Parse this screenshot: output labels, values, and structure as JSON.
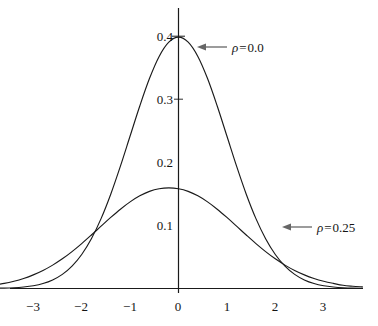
{
  "chart_data": {
    "type": "line",
    "title": "",
    "subtitle": "",
    "xlabel": "",
    "ylabel": "",
    "xlim": [
      -3.85,
      3.8
    ],
    "ylim": [
      0,
      0.44
    ],
    "grid": false,
    "legend_position": "inline-annotations",
    "x_ticks": [
      "−3",
      "−2",
      "−1",
      "0",
      "1",
      "2",
      "3"
    ],
    "x_tick_values": [
      -3,
      -2,
      -1,
      0,
      1,
      2,
      3
    ],
    "y_ticks": [
      "0.4",
      "0.3",
      "0.2",
      "0.1"
    ],
    "y_tick_values": [
      0.4,
      0.3,
      0.2,
      0.1
    ],
    "series": [
      {
        "name": "ρ = 0.0",
        "rho": 0.0,
        "peak": 0.399,
        "sigma": 1.0,
        "x": [
          -3.85,
          -3.6,
          -3.4,
          -3.2,
          -3.0,
          -2.8,
          -2.6,
          -2.4,
          -2.2,
          -2.0,
          -1.8,
          -1.6,
          -1.4,
          -1.2,
          -1.0,
          -0.8,
          -0.6,
          -0.4,
          -0.2,
          0.0,
          0.2,
          0.4,
          0.6,
          0.8,
          1.0,
          1.2,
          1.4,
          1.6,
          1.8,
          2.0,
          2.2,
          2.4,
          2.6,
          2.8,
          3.0,
          3.2,
          3.4,
          3.6,
          3.8
        ],
        "values": [
          0.0004,
          0.0006,
          0.0012,
          0.0024,
          0.0044,
          0.0079,
          0.0136,
          0.0224,
          0.0355,
          0.054,
          0.079,
          0.1109,
          0.1497,
          0.1942,
          0.242,
          0.2897,
          0.3332,
          0.3683,
          0.391,
          0.3989,
          0.391,
          0.3683,
          0.3332,
          0.2897,
          0.242,
          0.1942,
          0.1497,
          0.1109,
          0.079,
          0.054,
          0.0355,
          0.0224,
          0.0136,
          0.0079,
          0.0044,
          0.0024,
          0.0012,
          0.0006,
          0.0004
        ]
      },
      {
        "name": "ρ = 0.25",
        "rho": 0.25,
        "peak": 0.332,
        "sigma": 1.2,
        "x": [
          -3.85,
          -3.6,
          -3.4,
          -3.2,
          -3.0,
          -2.8,
          -2.6,
          -2.4,
          -2.2,
          -2.0,
          -1.8,
          -1.6,
          -1.4,
          -1.2,
          -1.0,
          -0.8,
          -0.6,
          -0.4,
          -0.2,
          0.0,
          0.2,
          0.4,
          0.6,
          0.8,
          1.0,
          1.2,
          1.4,
          1.6,
          1.8,
          2.0,
          2.2,
          2.4,
          2.6,
          2.8,
          3.0,
          3.2,
          3.4,
          3.6,
          3.8
        ],
        "values": [
          0.0051,
          0.0081,
          0.0115,
          0.0159,
          0.0216,
          0.0286,
          0.0371,
          0.0471,
          0.0586,
          0.0713,
          0.0849,
          0.0989,
          0.1128,
          0.1259,
          0.1375,
          0.1471,
          0.1542,
          0.1584,
          0.1598,
          0.1584,
          0.1542,
          0.1471,
          0.1375,
          0.1259,
          0.1128,
          0.0989,
          0.0849,
          0.0713,
          0.0586,
          0.0471,
          0.0371,
          0.0286,
          0.0216,
          0.0159,
          0.0115,
          0.0081,
          0.0051,
          0.0036,
          0.0025
        ]
      }
    ],
    "annotations": [
      {
        "id": "rho-0",
        "symbol": "ρ",
        "operator": "=",
        "value": "0.0",
        "text": "ρ = 0.0",
        "arrow": "left-arrow"
      },
      {
        "id": "rho-025",
        "symbol": "ρ",
        "operator": "=",
        "value": "0.25",
        "text": "ρ = 0.25",
        "arrow": "left-arrow"
      }
    ],
    "colors": {
      "background": "#ffffff",
      "axis": "#1a1a1a",
      "curve": "#1a1a1a",
      "arrow": "#555555",
      "text": "#141414"
    }
  }
}
